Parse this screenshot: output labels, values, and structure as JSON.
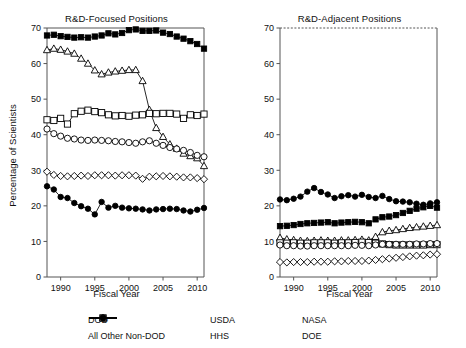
{
  "figure": {
    "width": 466,
    "height": 348,
    "background": "#ffffff",
    "line_color": "#000000",
    "axis_color": "#555555"
  },
  "legend": {
    "position": "bottom-center",
    "entries": [
      {
        "label": "DOD",
        "marker": "open-square",
        "name": "legend-item-dod"
      },
      {
        "label": "USDA",
        "marker": "open-diamond",
        "name": "legend-item-usda"
      },
      {
        "label": "NASA",
        "marker": "filled-square",
        "name": "legend-item-nasa"
      },
      {
        "label": "All Other Non-DOD",
        "marker": "open-circle",
        "name": "legend-item-all-other-non-dod"
      },
      {
        "label": "HHS",
        "marker": "open-triangle",
        "name": "legend-item-hhs"
      },
      {
        "label": "DOE",
        "marker": "filled-circle",
        "name": "legend-item-doe"
      }
    ]
  },
  "chart_data": [
    {
      "type": "line",
      "panel": "left",
      "title": "R&D-Focused Positions",
      "xlabel": "Fiscal Year",
      "ylabel": "Percentage of Scientists",
      "xlim": [
        1988,
        2011
      ],
      "ylim": [
        0,
        70
      ],
      "xticks": [
        1990,
        1995,
        2000,
        2005,
        2010
      ],
      "yticks": [
        0,
        10,
        20,
        30,
        40,
        50,
        60,
        70
      ],
      "grid": false,
      "top_spine": "solid",
      "x": [
        1988,
        1989,
        1990,
        1991,
        1992,
        1993,
        1994,
        1995,
        1996,
        1997,
        1998,
        1999,
        2000,
        2001,
        2002,
        2003,
        2004,
        2005,
        2006,
        2007,
        2008,
        2009,
        2010,
        2011
      ],
      "series": [
        {
          "name": "NASA",
          "marker": "filled-square",
          "values": [
            67.9,
            68.1,
            67.7,
            67.5,
            67.3,
            67.4,
            67.3,
            67.6,
            67.9,
            68.5,
            68.2,
            68.6,
            69.4,
            69.6,
            69.2,
            69.2,
            69.3,
            68.7,
            68.3,
            67.6,
            67.0,
            66.3,
            65.5,
            64.2
          ]
        },
        {
          "name": "HHS",
          "marker": "open-triangle",
          "values": [
            63.8,
            64.2,
            63.9,
            63.4,
            62.8,
            61.4,
            60.0,
            58.1,
            57.0,
            57.5,
            57.8,
            58.0,
            58.2,
            58.2,
            55.1,
            47.0,
            41.9,
            39.4,
            37.3,
            36.1,
            34.7,
            34.0,
            33.4,
            31.2
          ]
        },
        {
          "name": "DOD",
          "marker": "open-square",
          "values": [
            44.2,
            44.0,
            44.6,
            43.0,
            45.9,
            46.6,
            46.9,
            46.5,
            46.2,
            45.6,
            45.3,
            45.4,
            45.2,
            45.5,
            45.6,
            46.0,
            45.9,
            46.0,
            46.0,
            45.8,
            44.6,
            45.6,
            45.4,
            45.8
          ]
        },
        {
          "name": "All Other Non-DOD",
          "marker": "open-circle",
          "values": [
            41.6,
            40.3,
            39.6,
            39.0,
            38.8,
            38.5,
            38.4,
            38.5,
            38.4,
            38.3,
            38.1,
            38.0,
            37.8,
            37.6,
            38.0,
            38.3,
            37.6,
            37.0,
            36.4,
            36.0,
            35.6,
            35.0,
            34.2,
            33.8
          ]
        },
        {
          "name": "USDA",
          "marker": "open-diamond",
          "values": [
            29.6,
            28.7,
            28.4,
            28.3,
            28.4,
            28.5,
            28.4,
            28.6,
            28.6,
            28.6,
            28.5,
            28.6,
            28.6,
            28.5,
            27.6,
            28.2,
            28.3,
            28.4,
            28.3,
            28.2,
            28.0,
            28.0,
            27.8,
            27.5
          ]
        },
        {
          "name": "DOE",
          "marker": "filled-circle",
          "values": [
            25.5,
            24.6,
            22.5,
            22.2,
            20.8,
            19.9,
            19.2,
            17.6,
            21.1,
            19.5,
            20.0,
            19.5,
            19.3,
            19.2,
            19.0,
            18.7,
            19.0,
            19.1,
            19.2,
            19.1,
            18.7,
            18.4,
            18.9,
            19.4
          ]
        }
      ]
    },
    {
      "type": "line",
      "panel": "right",
      "title": "R&D-Adjacent Positions",
      "xlabel": "Fiscal Year",
      "ylabel": "",
      "xlim": [
        1988,
        2011
      ],
      "ylim": [
        0,
        70
      ],
      "xticks": [
        1990,
        1995,
        2000,
        2005,
        2010
      ],
      "yticks": [
        0,
        10,
        20,
        30,
        40,
        50,
        60,
        70
      ],
      "grid": false,
      "top_spine": "dashed",
      "x": [
        1988,
        1989,
        1990,
        1991,
        1992,
        1993,
        1994,
        1995,
        1996,
        1997,
        1998,
        1999,
        2000,
        2001,
        2002,
        2003,
        2004,
        2005,
        2006,
        2007,
        2008,
        2009,
        2010,
        2011
      ],
      "series": [
        {
          "name": "DOE",
          "marker": "filled-circle",
          "values": [
            21.8,
            21.6,
            22.0,
            22.6,
            24.0,
            25.0,
            23.9,
            23.2,
            22.2,
            22.7,
            23.0,
            22.6,
            23.1,
            22.5,
            22.2,
            22.8,
            21.9,
            21.3,
            21.2,
            21.0,
            20.6,
            20.3,
            20.7,
            21.0
          ]
        },
        {
          "name": "NASA",
          "marker": "filled-square",
          "values": [
            14.3,
            14.4,
            14.6,
            14.9,
            15.1,
            15.2,
            15.3,
            15.4,
            15.1,
            15.3,
            15.4,
            15.5,
            15.4,
            15.1,
            16.2,
            16.8,
            17.0,
            17.4,
            18.0,
            18.6,
            19.2,
            19.6,
            20.0,
            19.5
          ]
        },
        {
          "name": "HHS",
          "marker": "open-triangle",
          "values": [
            11.0,
            10.6,
            10.4,
            10.2,
            10.1,
            10.2,
            10.3,
            10.2,
            10.2,
            10.3,
            10.3,
            10.4,
            10.5,
            10.3,
            11.3,
            12.6,
            13.0,
            13.2,
            13.5,
            13.8,
            14.0,
            14.2,
            14.4,
            14.6
          ]
        },
        {
          "name": "DOD",
          "marker": "open-square",
          "values": [
            9.6,
            9.5,
            9.6,
            9.5,
            9.5,
            9.6,
            9.6,
            9.6,
            9.5,
            9.6,
            9.6,
            9.7,
            9.8,
            9.7,
            9.5,
            9.3,
            9.1,
            9.0,
            9.0,
            9.0,
            9.0,
            9.0,
            9.1,
            9.1
          ]
        },
        {
          "name": "All Other Non-DOD",
          "marker": "open-circle",
          "values": [
            9.0,
            8.8,
            8.8,
            8.7,
            8.7,
            8.8,
            8.8,
            8.8,
            8.8,
            8.8,
            8.8,
            8.9,
            8.9,
            8.8,
            9.0,
            9.2,
            9.2,
            9.2,
            9.2,
            9.2,
            9.3,
            9.3,
            9.4,
            9.4
          ]
        },
        {
          "name": "USDA",
          "marker": "open-diamond",
          "values": [
            4.2,
            4.1,
            4.2,
            4.2,
            4.2,
            4.3,
            4.3,
            4.3,
            4.4,
            4.4,
            4.5,
            4.5,
            4.5,
            4.6,
            4.8,
            5.0,
            5.2,
            5.4,
            5.6,
            5.8,
            6.0,
            6.1,
            6.3,
            6.4
          ]
        }
      ]
    }
  ]
}
